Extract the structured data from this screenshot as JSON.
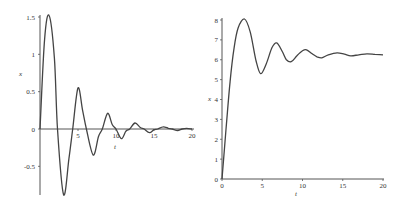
{
  "chart_data": [
    {
      "type": "line",
      "title": "",
      "xlabel": "t",
      "ylabel": "x",
      "xlim": [
        0,
        20
      ],
      "ylim": [
        -0.9,
        1.55
      ],
      "grid": false,
      "x_ticks": [
        "5",
        "10",
        "15",
        "20"
      ],
      "y_ticks": [
        "1.5",
        "1",
        "0.5",
        "0",
        "-0.5"
      ],
      "series": [
        {
          "name": "x(t) damped oscillation",
          "x": [
            0,
            0.6,
            1.2,
            1.9,
            2.3,
            3.1,
            3.8,
            4.3,
            5.0,
            5.6,
            6.1,
            7.0,
            7.7,
            8.2,
            8.9,
            9.5,
            10.0,
            10.7,
            11.3,
            11.8,
            12.5,
            13.2,
            13.7,
            14.4,
            15.0,
            15.5,
            16.2,
            16.9,
            17.4,
            18.1,
            18.7,
            19.3,
            20
          ],
          "values": [
            0,
            1.2,
            1.52,
            0.95,
            0.0,
            -0.88,
            -0.4,
            0.0,
            0.55,
            0.25,
            0.0,
            -0.35,
            -0.1,
            0.0,
            0.21,
            0.06,
            0.0,
            -0.13,
            -0.03,
            0.0,
            0.08,
            0.02,
            0.0,
            -0.05,
            -0.01,
            0.0,
            0.03,
            0.01,
            0.0,
            -0.02,
            0.0,
            0.01,
            0.0
          ]
        }
      ]
    },
    {
      "type": "line",
      "title": "",
      "xlabel": "t",
      "ylabel": "x",
      "xlim": [
        0,
        20
      ],
      "ylim": [
        0,
        8
      ],
      "grid": false,
      "x_ticks": [
        "0",
        "5",
        "10",
        "15",
        "20"
      ],
      "y_ticks": [
        "0",
        "1",
        "2",
        "3",
        "4",
        "5",
        "6",
        "7",
        "8"
      ],
      "series": [
        {
          "name": "x(t) step response",
          "x": [
            0,
            0.5,
            1.0,
            1.5,
            2.0,
            2.8,
            3.5,
            4.2,
            4.8,
            5.5,
            6.2,
            6.8,
            7.5,
            8.0,
            8.6,
            9.3,
            10.0,
            10.5,
            11.2,
            11.8,
            12.4,
            13.2,
            14.3,
            15.2,
            16.0,
            17.0,
            18.0,
            19.0,
            20
          ],
          "values": [
            0,
            2.5,
            4.9,
            6.6,
            7.6,
            8.05,
            7.4,
            6.0,
            5.3,
            5.8,
            6.6,
            6.85,
            6.4,
            6.0,
            5.9,
            6.2,
            6.45,
            6.5,
            6.3,
            6.15,
            6.1,
            6.25,
            6.35,
            6.28,
            6.2,
            6.25,
            6.3,
            6.27,
            6.25
          ]
        }
      ]
    }
  ],
  "left": {
    "xlabel": "t",
    "ylabel": "x",
    "x_ticks": [
      {
        "v": 5,
        "label": "5"
      },
      {
        "v": 10,
        "label": "10"
      },
      {
        "v": 15,
        "label": "15"
      },
      {
        "v": 20,
        "label": "20"
      }
    ],
    "y_ticks": [
      {
        "v": 1.5,
        "label": "1.5"
      },
      {
        "v": 1,
        "label": "1"
      },
      {
        "v": 0.5,
        "label": "0.5"
      },
      {
        "v": 0,
        "label": "0"
      },
      {
        "v": -0.5,
        "label": "-0.5"
      }
    ]
  },
  "right": {
    "xlabel": "t",
    "ylabel": "x",
    "x_ticks": [
      {
        "v": 0,
        "label": "0"
      },
      {
        "v": 5,
        "label": "5"
      },
      {
        "v": 10,
        "label": "10"
      },
      {
        "v": 15,
        "label": "15"
      },
      {
        "v": 20,
        "label": "20"
      }
    ],
    "y_ticks": [
      {
        "v": 0,
        "label": "0"
      },
      {
        "v": 1,
        "label": "1"
      },
      {
        "v": 2,
        "label": "2"
      },
      {
        "v": 3,
        "label": "3"
      },
      {
        "v": 4,
        "label": "4"
      },
      {
        "v": 5,
        "label": "5"
      },
      {
        "v": 6,
        "label": "6"
      },
      {
        "v": 7,
        "label": "7"
      },
      {
        "v": 8,
        "label": "8"
      }
    ]
  }
}
